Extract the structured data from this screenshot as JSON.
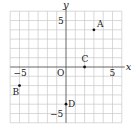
{
  "chart_data": {
    "type": "scatter",
    "title": "",
    "xlabel": "x",
    "ylabel": "y",
    "xlim": [
      -6,
      6
    ],
    "ylim": [
      -6,
      6
    ],
    "grid": true,
    "origin_label": "O",
    "tick_labels": {
      "x": [
        {
          "value": -5,
          "label": "-5"
        },
        {
          "value": 5,
          "label": "5"
        }
      ],
      "y": [
        {
          "value": 5,
          "label": "5"
        },
        {
          "value": -5,
          "label": "-5"
        }
      ]
    },
    "points": [
      {
        "label": "A",
        "x": 3,
        "y": 4
      },
      {
        "label": "B",
        "x": -5,
        "y": -2
      },
      {
        "label": "C",
        "x": 2,
        "y": 0
      },
      {
        "label": "D",
        "x": 0,
        "y": -4
      }
    ]
  },
  "colors": {
    "grid": "#c8c8c8",
    "axis": "#555555",
    "point": "#111111",
    "text": "#222222"
  }
}
